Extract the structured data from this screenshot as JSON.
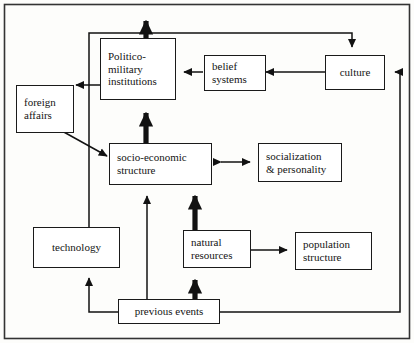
{
  "figure": {
    "type": "flow-diagram",
    "title": "",
    "border_color": "#333333",
    "node_border_color": "#1a1a1a",
    "background": "#fdfdfb"
  },
  "nodes": {
    "politico_military": {
      "lines": [
        "Politico-",
        "military",
        "institutions"
      ]
    },
    "belief_systems": {
      "lines": [
        "belief",
        "systems"
      ]
    },
    "culture": {
      "lines": [
        "culture"
      ]
    },
    "foreign_affairs": {
      "lines": [
        "foreign",
        "affairs"
      ]
    },
    "socio_economic": {
      "lines": [
        "socio-economic",
        "structure"
      ]
    },
    "socialization": {
      "lines": [
        "socialization",
        "& personality"
      ]
    },
    "technology": {
      "lines": [
        "technology"
      ]
    },
    "natural_resources": {
      "lines": [
        "natural",
        "resources"
      ]
    },
    "population_structure": {
      "lines": [
        "population",
        "structure"
      ]
    },
    "previous_events": {
      "lines": [
        "previous events"
      ]
    }
  },
  "edges": [
    {
      "from": "politico_military",
      "to": "out-top",
      "weight": "thick",
      "arrow": "single"
    },
    {
      "from": "belief_systems",
      "to": "politico_military",
      "weight": "thin",
      "arrow": "single"
    },
    {
      "from": "culture",
      "to": "belief_systems",
      "weight": "thin",
      "arrow": "single"
    },
    {
      "from": "politico_military",
      "to": "culture",
      "weight": "thin",
      "arrow": "single"
    },
    {
      "from": "politico_military",
      "to": "foreign_affairs",
      "weight": "thin",
      "arrow": "single"
    },
    {
      "from": "foreign_affairs",
      "to": "socio_economic",
      "weight": "thin",
      "arrow": "single"
    },
    {
      "from": "socio_economic",
      "to": "politico_military",
      "weight": "thick",
      "arrow": "single"
    },
    {
      "from": "socio_economic",
      "to": "socialization",
      "weight": "thin",
      "arrow": "double"
    },
    {
      "from": "natural_resources",
      "to": "socio_economic",
      "weight": "thick",
      "arrow": "single"
    },
    {
      "from": "natural_resources",
      "to": "population_structure",
      "weight": "thin",
      "arrow": "single"
    },
    {
      "from": "previous_events",
      "to": "natural_resources",
      "weight": "thick",
      "arrow": "single"
    },
    {
      "from": "previous_events",
      "to": "socio_economic",
      "weight": "thin",
      "arrow": "single"
    },
    {
      "from": "previous_events",
      "to": "technology",
      "weight": "thin",
      "arrow": "single"
    },
    {
      "from": "technology",
      "to": "culture",
      "weight": "thin",
      "arrow": "single"
    },
    {
      "from": "previous_events",
      "to": "culture",
      "weight": "thin",
      "arrow": "single"
    }
  ]
}
